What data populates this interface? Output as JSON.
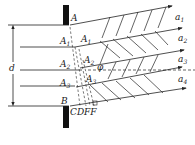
{
  "diagram": {
    "title": "",
    "labels": {
      "A": "A",
      "A1": "A",
      "A1_sub": "1",
      "A1p": "A",
      "A1p_sub": "1",
      "A2": "A",
      "A2_sub": "2",
      "A2p": "A",
      "A2p_sub": "2",
      "A3": "A",
      "A3_sub": "3",
      "A3p": "A",
      "A3p_sub": "3",
      "B": "B",
      "CDFF": "CDFF",
      "d": "d",
      "phi": "φ",
      "a1": "a",
      "a1_sub": "1",
      "a2": "a",
      "a2_sub": "2",
      "a3": "a",
      "a3_sub": "3",
      "a4": "a",
      "a4_sub": "4"
    },
    "colors": {
      "line": "#222222",
      "wall": "#111111"
    }
  }
}
